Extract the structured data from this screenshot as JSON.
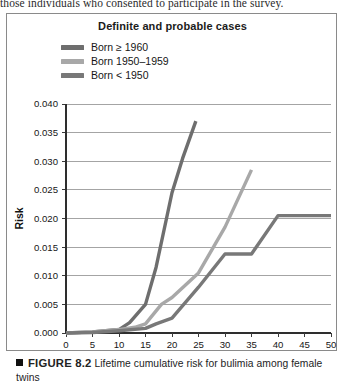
{
  "page": {
    "body_text_fragment": "those individuals who consented to participate in the survey."
  },
  "figure": {
    "caption_marker": "■",
    "caption_number": "FIGURE 8.2",
    "caption_text": "Lifetime cumulative risk for bulimia among female twins"
  },
  "chart_data": {
    "type": "line",
    "title": "Definite and probable cases",
    "xlabel": "Age",
    "ylabel": "Risk",
    "xlim": [
      0,
      50
    ],
    "ylim": [
      0.0,
      0.04
    ],
    "xticks": [
      0,
      5,
      10,
      15,
      20,
      25,
      30,
      35,
      40,
      45,
      50
    ],
    "yticks": [
      0.0,
      0.005,
      0.01,
      0.015,
      0.02,
      0.025,
      0.03,
      0.035,
      0.04
    ],
    "ytick_labels": [
      "0.000",
      "0.005",
      "0.010",
      "0.015",
      "0.020",
      "0.025",
      "0.030",
      "0.035",
      "0.040"
    ],
    "xtick_labels": [
      "0",
      "5",
      "10",
      "15",
      "20",
      "25",
      "30",
      "35",
      "40",
      "45",
      "50"
    ],
    "grid": "horizontal",
    "legend_position": "top-left",
    "series": [
      {
        "name": "Born ≥ 1960",
        "color": "#6e6e6e",
        "x": [
          0,
          5,
          10,
          12,
          15,
          17,
          20,
          22,
          24.5
        ],
        "values": [
          0.0,
          0.0002,
          0.0006,
          0.0018,
          0.005,
          0.0115,
          0.0245,
          0.0305,
          0.037
        ]
      },
      {
        "name": "Born 1950–1959",
        "color": "#a8a8a8",
        "x": [
          0,
          5,
          10,
          13,
          15,
          18,
          20,
          25,
          30,
          35
        ],
        "values": [
          0.0,
          0.0002,
          0.0006,
          0.001,
          0.0016,
          0.005,
          0.0062,
          0.0105,
          0.0185,
          0.0285
        ]
      },
      {
        "name": "Born < 1950",
        "color": "#787878",
        "x": [
          0,
          5,
          10,
          15,
          17,
          20,
          25,
          30,
          35,
          40,
          45,
          50
        ],
        "values": [
          0.0,
          0.0001,
          0.0004,
          0.0008,
          0.0016,
          0.0026,
          0.008,
          0.0138,
          0.0138,
          0.0205,
          0.0205,
          0.0205
        ]
      }
    ]
  }
}
